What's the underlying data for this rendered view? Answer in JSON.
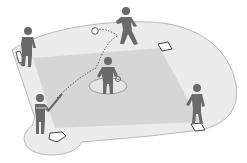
{
  "illustration": {
    "subject": "baseball-field-diagram",
    "colors": {
      "background": "#ffffff",
      "field": "#ececec",
      "field_outline": "#b8b8b8",
      "infield": "#d6d6d6",
      "mound": "#e4e4e4",
      "mound_outline": "#9a9a9a",
      "figure": "#6a6a6a",
      "base": "#ffffff",
      "base_outline": "#444444",
      "ball_path": "#555555"
    },
    "figures": [
      {
        "role": "batter",
        "x": 40,
        "y": 115
      },
      {
        "role": "pitcher",
        "x": 106,
        "y": 80
      },
      {
        "role": "catcher-left-fielder",
        "x": 27,
        "y": 45
      },
      {
        "role": "second-base-fielder",
        "x": 127,
        "y": 25
      },
      {
        "role": "first-base-fielder",
        "x": 196,
        "y": 105
      }
    ],
    "bases": [
      "home-plate",
      "first-base",
      "second-base",
      "third-base"
    ],
    "ball": {
      "x": 95,
      "y": 31
    }
  }
}
